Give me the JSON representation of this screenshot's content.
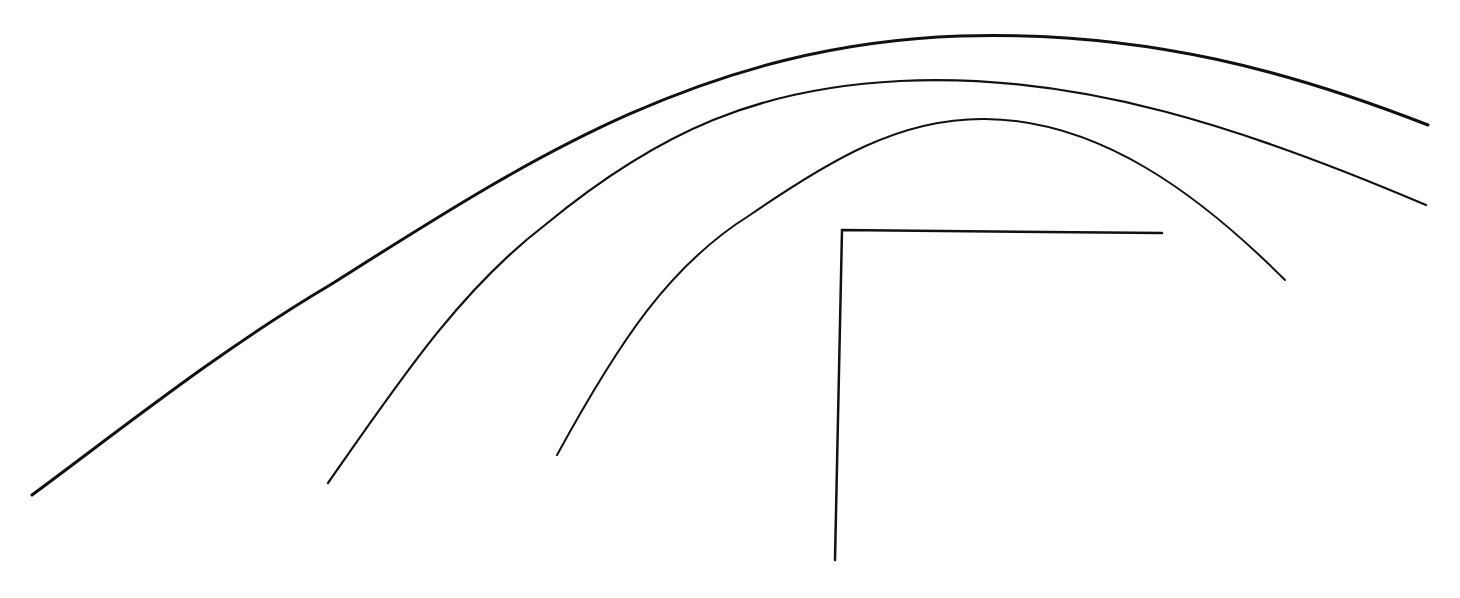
{
  "diagram": {
    "background": "#ffffff",
    "stroke_color": "#111111",
    "arcs": [
      {
        "id": "outer-arc",
        "stroke_width": 3,
        "path": "M32,495 C120,430 220,350 330,285 C520,165 700,45 960,36 C1150,30 1300,75 1428,125"
      },
      {
        "id": "middle-arc",
        "stroke_width": 2.2,
        "path": "M328,483 C400,380 460,290 545,225 C660,130 760,88 900,81 C1080,72 1250,130 1426,205"
      },
      {
        "id": "inner-arc",
        "stroke_width": 2,
        "path": "M557,455 C620,340 670,265 750,215 C830,160 900,118 985,119 C1100,120 1200,195 1285,280"
      }
    ],
    "bracket": {
      "id": "corner-bracket",
      "stroke_width": 2.5,
      "points": "835,560 842,230 1162,233"
    }
  }
}
